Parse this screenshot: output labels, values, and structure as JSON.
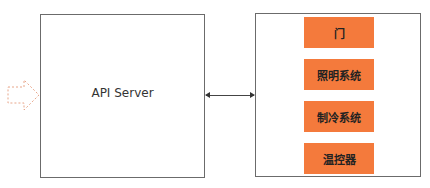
{
  "diagram": {
    "api_server": {
      "label": "API Server"
    },
    "devices": {
      "items": [
        {
          "label": "门"
        },
        {
          "label": "照明系统"
        },
        {
          "label": "制冷系统"
        },
        {
          "label": "温控器"
        }
      ]
    },
    "colors": {
      "device_fill": "#f47a3c",
      "border": "#6b6b6b",
      "input_arrow": "#e8a68a"
    }
  }
}
